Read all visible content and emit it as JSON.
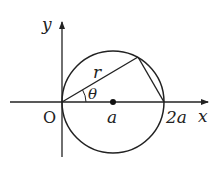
{
  "diagram": {
    "type": "geometry",
    "labels": {
      "y_axis": "y",
      "x_axis": "x",
      "origin": "O",
      "center": "a",
      "far_point": "2a",
      "chord_length": "r",
      "angle": "θ"
    },
    "colors": {
      "stroke": "#222222",
      "background": "#ffffff"
    }
  }
}
